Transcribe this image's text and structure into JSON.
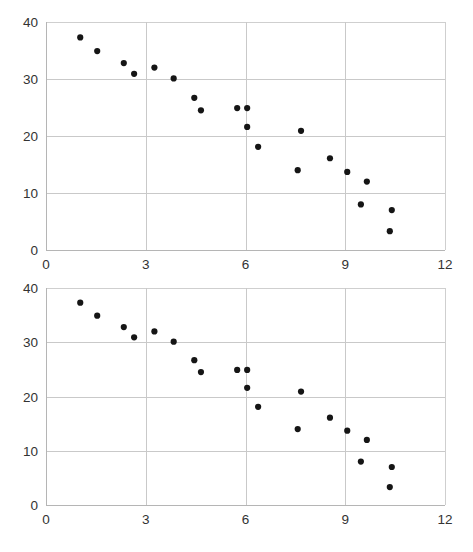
{
  "figure": {
    "name": "scatter-plot-pair",
    "background_color": "#ffffff",
    "point_color": "#151515",
    "gridline_color": "#c9c9c9",
    "axis_color": "#b5b5b5",
    "label_color": "#333333"
  },
  "charts": [
    {
      "id": "chart-top",
      "chart_data": {
        "type": "scatter",
        "title": "",
        "subtitle": "",
        "xlabel": "",
        "ylabel": "",
        "xlim": [
          0,
          12
        ],
        "ylim": [
          0,
          40
        ],
        "xticks": [
          0,
          3,
          6,
          9,
          12
        ],
        "yticks": [
          0,
          10,
          20,
          30,
          40
        ],
        "xtick_labels": [
          "0",
          "3",
          "6",
          "9",
          "12"
        ],
        "ytick_labels": [
          "0",
          "10",
          "20",
          "30",
          "40"
        ],
        "grid": true,
        "legend": false,
        "series": [
          {
            "name": "series-1",
            "marker": "circle",
            "color": "#151515",
            "points": [
              [
                1.03,
                37.3
              ],
              [
                1.54,
                34.9
              ],
              [
                2.34,
                32.8
              ],
              [
                2.65,
                30.9
              ],
              [
                3.26,
                32.0
              ],
              [
                3.84,
                30.1
              ],
              [
                4.46,
                26.7
              ],
              [
                4.66,
                24.5
              ],
              [
                5.75,
                24.9
              ],
              [
                6.05,
                24.9
              ],
              [
                6.05,
                21.6
              ],
              [
                6.38,
                18.1
              ],
              [
                7.57,
                14.0
              ],
              [
                7.67,
                20.9
              ],
              [
                8.54,
                16.1
              ],
              [
                9.06,
                13.7
              ],
              [
                9.47,
                8.0
              ],
              [
                9.65,
                12.0
              ],
              [
                10.34,
                3.3
              ],
              [
                10.4,
                7.0
              ]
            ]
          }
        ]
      }
    },
    {
      "id": "chart-bot",
      "chart_data": {
        "type": "scatter",
        "title": "",
        "subtitle": "",
        "xlabel": "",
        "ylabel": "",
        "xlim": [
          0,
          12
        ],
        "ylim": [
          0,
          40
        ],
        "xticks": [
          0,
          3,
          6,
          9,
          12
        ],
        "yticks": [
          0,
          10,
          20,
          30,
          40
        ],
        "xtick_labels": [
          "0",
          "3",
          "6",
          "9",
          "12"
        ],
        "ytick_labels": [
          "0",
          "10",
          "20",
          "30",
          "40"
        ],
        "grid": true,
        "legend": false,
        "series": [
          {
            "name": "series-1",
            "marker": "circle",
            "color": "#151515",
            "points": [
              [
                1.03,
                37.3
              ],
              [
                1.54,
                34.9
              ],
              [
                2.34,
                32.8
              ],
              [
                2.65,
                30.9
              ],
              [
                3.26,
                32.0
              ],
              [
                3.84,
                30.1
              ],
              [
                4.46,
                26.7
              ],
              [
                4.66,
                24.5
              ],
              [
                5.75,
                24.9
              ],
              [
                6.05,
                24.9
              ],
              [
                6.05,
                21.6
              ],
              [
                6.38,
                18.1
              ],
              [
                7.57,
                14.0
              ],
              [
                7.67,
                20.9
              ],
              [
                8.54,
                16.1
              ],
              [
                9.06,
                13.7
              ],
              [
                9.47,
                8.0
              ],
              [
                9.65,
                12.0
              ],
              [
                10.34,
                3.3
              ],
              [
                10.4,
                7.0
              ]
            ]
          }
        ]
      }
    }
  ]
}
